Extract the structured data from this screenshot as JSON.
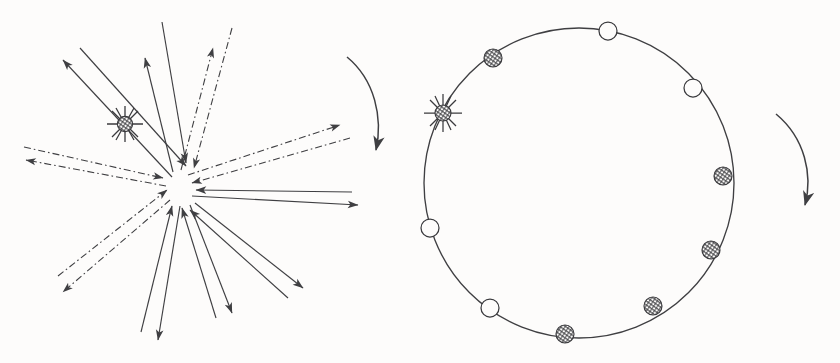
{
  "figure": {
    "background_color": "#fdfcfb",
    "ink_color": "#3f3f42",
    "width": 840,
    "height": 363
  },
  "panels": [
    {
      "id": "left-panel",
      "name": "radial-arrow-burst",
      "center": {
        "x": 180,
        "y": 185
      },
      "description": "Starburst of paired arrows radiating from and converging on a central point",
      "star_marker": {
        "x": 125,
        "y": 124,
        "radius": 8,
        "rays": 6,
        "style": "hatched-circle-with-star-rays"
      },
      "arrow_pairs": [
        {
          "index": 0,
          "angle_deg": 223,
          "outward_tip": {
            "x": 63,
            "y": 60
          },
          "inward_tail": {
            "x": 80,
            "y": 48
          },
          "style": "solid",
          "length": 165
        },
        {
          "index": 1,
          "angle_deg": 258,
          "outward_tip": {
            "x": 145,
            "y": 58
          },
          "inward_tail": {
            "x": 162,
            "y": 22
          },
          "style": "solid",
          "length": 140
        },
        {
          "index": 2,
          "angle_deg": 290,
          "outward_tip": {
            "x": 213,
            "y": 48
          },
          "inward_tail": {
            "x": 232,
            "y": 28
          },
          "style": "dash-dot",
          "length": 150
        },
        {
          "index": 3,
          "angle_deg": 340,
          "outward_tip": {
            "x": 340,
            "y": 125
          },
          "inward_tail": {
            "x": 350,
            "y": 138
          },
          "style": "dash-dot",
          "length": 168
        },
        {
          "index": 4,
          "angle_deg": 10,
          "outward_tip": {
            "x": 358,
            "y": 205
          },
          "inward_tail": {
            "x": 352,
            "y": 192
          },
          "style": "solid",
          "length": 178
        },
        {
          "index": 5,
          "angle_deg": 38,
          "outward_tip": {
            "x": 303,
            "y": 288
          },
          "inward_tail": {
            "x": 288,
            "y": 298
          },
          "style": "solid",
          "length": 160
        },
        {
          "index": 6,
          "angle_deg": 68,
          "outward_tip": {
            "x": 232,
            "y": 313
          },
          "inward_tail": {
            "x": 216,
            "y": 318
          },
          "style": "solid",
          "length": 145
        },
        {
          "index": 7,
          "angle_deg": 95,
          "outward_tip": {
            "x": 158,
            "y": 340
          },
          "inward_tail": {
            "x": 141,
            "y": 332
          },
          "style": "solid",
          "length": 158
        },
        {
          "index": 8,
          "angle_deg": 138,
          "outward_tip": {
            "x": 63,
            "y": 292
          },
          "inward_tail": {
            "x": 58,
            "y": 276
          },
          "style": "dash-dot",
          "length": 155
        },
        {
          "index": 9,
          "angle_deg": 182,
          "outward_tip": {
            "x": 26,
            "y": 160
          },
          "inward_tail": {
            "x": 24,
            "y": 147
          },
          "style": "dash-dot",
          "length": 157
        }
      ],
      "curved_arrow": {
        "name": "rotation-arrow-left",
        "start": {
          "x": 347,
          "y": 57
        },
        "end": {
          "x": 377,
          "y": 157
        },
        "direction": "clockwise-downward"
      }
    },
    {
      "id": "right-panel",
      "name": "circular-marker-ring",
      "circle": {
        "center_x": 579,
        "center_y": 183,
        "radius": 155
      },
      "description": "Circle with alternating hatched and open markers placed on the circumference",
      "markers": [
        {
          "index": 0,
          "type": "open-circle",
          "x": 608,
          "y": 31,
          "radius": 9,
          "angle_deg": -79
        },
        {
          "index": 1,
          "type": "hatched-circle",
          "x": 493,
          "y": 58,
          "radius": 9,
          "angle_deg": -125
        },
        {
          "index": 2,
          "type": "star-marker",
          "x": 443,
          "y": 113,
          "radius": 8,
          "angle_deg": -155,
          "rays": 6
        },
        {
          "index": 3,
          "type": "open-circle",
          "x": 430,
          "y": 228,
          "radius": 9,
          "angle_deg": 163
        },
        {
          "index": 4,
          "type": "open-circle",
          "x": 490,
          "y": 308,
          "radius": 9,
          "angle_deg": 125
        },
        {
          "index": 5,
          "type": "hatched-circle",
          "x": 565,
          "y": 334,
          "radius": 9,
          "angle_deg": 95
        },
        {
          "index": 6,
          "type": "hatched-circle",
          "x": 653,
          "y": 306,
          "radius": 9,
          "angle_deg": 52
        },
        {
          "index": 7,
          "type": "hatched-circle",
          "x": 711,
          "y": 250,
          "radius": 9,
          "angle_deg": 26
        },
        {
          "index": 8,
          "type": "hatched-circle",
          "x": 723,
          "y": 176,
          "radius": 9,
          "angle_deg": -3
        },
        {
          "index": 9,
          "type": "open-circle",
          "x": 693,
          "y": 88,
          "radius": 9,
          "angle_deg": -38
        }
      ],
      "curved_arrow": {
        "name": "rotation-arrow-right",
        "start": {
          "x": 776,
          "y": 114
        },
        "end": {
          "x": 806,
          "y": 212
        },
        "direction": "clockwise-downward"
      }
    }
  ],
  "legend": {
    "marker_types": [
      {
        "key": "hatched-circle",
        "label": "filled hatched node"
      },
      {
        "key": "open-circle",
        "label": "open node"
      },
      {
        "key": "star-marker",
        "label": "star / reference node"
      }
    ],
    "line_styles": [
      {
        "key": "solid",
        "label": "solid arrow"
      },
      {
        "key": "dash-dot",
        "label": "dash-dot arrow"
      }
    ]
  }
}
